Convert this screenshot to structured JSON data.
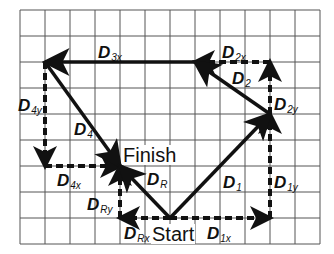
{
  "diagram": {
    "type": "vector-addition",
    "grid": {
      "cols": 12,
      "rows": 9,
      "origin_px": [
        20,
        10
      ],
      "cell_w": 25,
      "cell_h": 26,
      "line_color": "#555555"
    },
    "points": {
      "start": [
        6,
        8
      ],
      "p1": [
        10,
        4
      ],
      "p2": [
        7,
        2
      ],
      "p3": [
        1,
        2
      ],
      "finish": [
        4,
        6
      ]
    },
    "words": {
      "start": "Start",
      "finish": "Finish"
    },
    "vectors": [
      {
        "id": "D1",
        "main": "D",
        "sub": "1",
        "from": "start",
        "to": "p1",
        "style": "solid"
      },
      {
        "id": "D2",
        "main": "D",
        "sub": "2",
        "from": "p1",
        "to": "p2",
        "style": "solid"
      },
      {
        "id": "D3x",
        "main": "D",
        "sub": "3x",
        "from": "p2",
        "to": "p3",
        "style": "solid"
      },
      {
        "id": "D4",
        "main": "D",
        "sub": "4",
        "from": "p3",
        "to": "finish",
        "style": "solid"
      },
      {
        "id": "DR",
        "main": "D",
        "sub": "R",
        "from": "start",
        "to": "finish",
        "style": "solid"
      }
    ],
    "components": [
      {
        "id": "D1x",
        "main": "D",
        "sub": "1x",
        "from": [
          6,
          8
        ],
        "to": [
          10,
          8
        ]
      },
      {
        "id": "D1y",
        "main": "D",
        "sub": "1y",
        "from": [
          10,
          8
        ],
        "to": [
          10,
          4
        ]
      },
      {
        "id": "D2x",
        "main": "D",
        "sub": "2x",
        "from": [
          10,
          2
        ],
        "to": [
          7,
          2
        ]
      },
      {
        "id": "D2y",
        "main": "D",
        "sub": "2y",
        "from": [
          10,
          4
        ],
        "to": [
          10,
          2
        ]
      },
      {
        "id": "D4y",
        "main": "D",
        "sub": "4y",
        "from": [
          1,
          2
        ],
        "to": [
          1,
          6
        ]
      },
      {
        "id": "D4x",
        "main": "D",
        "sub": "4x",
        "from": [
          1,
          6
        ],
        "to": [
          4,
          6
        ]
      },
      {
        "id": "DRx",
        "main": "D",
        "sub": "Rx",
        "from": [
          6,
          8
        ],
        "to": [
          4,
          8
        ]
      },
      {
        "id": "DRy",
        "main": "D",
        "sub": "Ry",
        "from": [
          4,
          8
        ],
        "to": [
          4,
          6
        ]
      }
    ],
    "labels": {
      "D1": {
        "main": "D",
        "sub": "1"
      },
      "D1x": {
        "main": "D",
        "sub": "1x"
      },
      "D1y": {
        "main": "D",
        "sub": "1y"
      },
      "D2": {
        "main": "D",
        "sub": "2"
      },
      "D2x": {
        "main": "D",
        "sub": "2x"
      },
      "D2y": {
        "main": "D",
        "sub": "2y"
      },
      "D3x": {
        "main": "D",
        "sub": "3x"
      },
      "D4": {
        "main": "D",
        "sub": "4"
      },
      "D4x": {
        "main": "D",
        "sub": "4x"
      },
      "D4y": {
        "main": "D",
        "sub": "4y"
      },
      "DR": {
        "main": "D",
        "sub": "R"
      },
      "DRx": {
        "main": "D",
        "sub": "Rx"
      },
      "DRy": {
        "main": "D",
        "sub": "Ry"
      }
    }
  }
}
